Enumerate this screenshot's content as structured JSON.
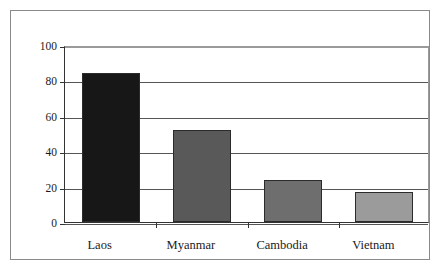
{
  "chart_data": {
    "type": "bar",
    "title": "",
    "xlabel": "",
    "ylabel": "",
    "categories": [
      "Laos",
      "Myanmar",
      "Cambodia",
      "Vietnam"
    ],
    "values": [
      84,
      52,
      24,
      17
    ],
    "bar_colors": [
      "#171717",
      "#595959",
      "#6e6e6e",
      "#9b9b9b"
    ],
    "ylim": [
      0,
      100
    ],
    "yticks": [
      0,
      20,
      40,
      60,
      80,
      100
    ],
    "ytick_labels": [
      "0",
      "20",
      "40",
      "60",
      "80",
      "100"
    ],
    "grid": true,
    "grid_axis": "y",
    "legend": "none",
    "series": [
      {
        "name": "",
        "values": [
          84,
          52,
          24,
          17
        ]
      }
    ]
  },
  "frame": {
    "border_color": "#8a8a8a",
    "plot_border_color": "#9a9a9a",
    "axis_color": "#333333"
  }
}
